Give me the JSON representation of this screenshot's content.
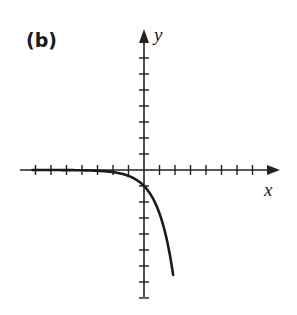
{
  "panel": {
    "label": "(b)"
  },
  "chart_data": {
    "type": "line",
    "title": "(b)",
    "xlabel": "x",
    "ylabel": "y",
    "function": "y = -e^x",
    "grid": false,
    "legend": null,
    "tick_labels": false,
    "x_ticks": [
      -7,
      -6,
      -5,
      -4,
      -3,
      -2,
      -1,
      1,
      2,
      3,
      4,
      5,
      6,
      7
    ],
    "y_ticks": [
      -8,
      -7,
      -6,
      -5,
      -4,
      -3,
      -2,
      -1,
      1,
      2,
      3,
      4,
      5,
      6,
      7
    ],
    "xlim": [
      -8,
      8.5
    ],
    "ylim": [
      -8,
      8.7
    ],
    "x": [
      -8,
      -7,
      -6,
      -5,
      -4,
      -3,
      -2,
      -1,
      -0.5,
      0,
      0.5,
      1,
      1.5,
      1.9
    ],
    "y": [
      -0.0003,
      -0.0009,
      -0.0025,
      -0.0067,
      -0.018,
      -0.05,
      -0.135,
      -0.368,
      -0.607,
      -1,
      -1.649,
      -2.718,
      -4.482,
      -6.686
    ],
    "annotations": []
  },
  "axes": {
    "x_label": "x",
    "y_label": "y"
  }
}
